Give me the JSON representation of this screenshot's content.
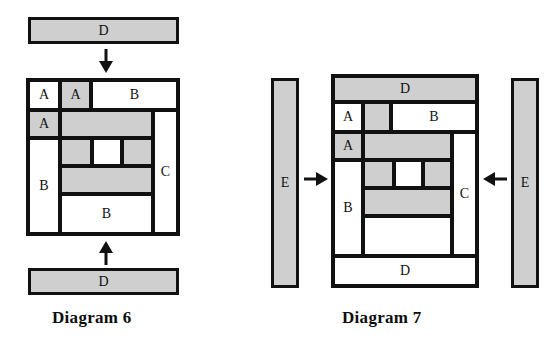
{
  "page": {
    "background": "#ffffff",
    "ink": "#111111",
    "shaded_fill": "#cfcfcf",
    "unshaded_fill": "#ffffff"
  },
  "diagram6": {
    "caption": "Diagram 6",
    "top_bar": {
      "label": "D",
      "shaded": true
    },
    "bottom_bar": {
      "label": "D",
      "shaded": true
    },
    "top_arrow": {
      "name": "arrow-down",
      "direction": "down"
    },
    "bottom_arrow": {
      "name": "arrow-up",
      "direction": "up"
    },
    "cells": [
      {
        "id": "d6-a1",
        "label": "A",
        "shaded": false
      },
      {
        "id": "d6-a2",
        "label": "A",
        "shaded": true
      },
      {
        "id": "d6-b-top",
        "label": "B",
        "shaded": false
      },
      {
        "id": "d6-a3",
        "label": "A",
        "shaded": true
      },
      {
        "id": "d6-band1",
        "label": "",
        "shaded": true
      },
      {
        "id": "d6-c",
        "label": "C",
        "shaded": false
      },
      {
        "id": "d6-b-left",
        "label": "B",
        "shaded": false
      },
      {
        "id": "d6-mid-left",
        "label": "",
        "shaded": true
      },
      {
        "id": "d6-mid-center",
        "label": "",
        "shaded": false
      },
      {
        "id": "d6-mid-right",
        "label": "",
        "shaded": true
      },
      {
        "id": "d6-band2",
        "label": "",
        "shaded": true
      },
      {
        "id": "d6-b-bottom",
        "label": "B",
        "shaded": false
      }
    ]
  },
  "diagram7": {
    "caption": "Diagram 7",
    "left_bar": {
      "label": "E",
      "shaded": true
    },
    "right_bar": {
      "label": "E",
      "shaded": true
    },
    "left_arrow": {
      "name": "arrow-right",
      "direction": "right"
    },
    "right_arrow": {
      "name": "arrow-left",
      "direction": "left"
    },
    "cells": [
      {
        "id": "d7-d-top",
        "label": "D",
        "shaded": true
      },
      {
        "id": "d7-a1",
        "label": "A",
        "shaded": false
      },
      {
        "id": "d7-a2",
        "label": "",
        "shaded": true
      },
      {
        "id": "d7-b-top",
        "label": "B",
        "shaded": false
      },
      {
        "id": "d7-a3",
        "label": "A",
        "shaded": true
      },
      {
        "id": "d7-band1",
        "label": "",
        "shaded": true
      },
      {
        "id": "d7-c",
        "label": "C",
        "shaded": false
      },
      {
        "id": "d7-b-left",
        "label": "B",
        "shaded": false
      },
      {
        "id": "d7-mid-left",
        "label": "",
        "shaded": true
      },
      {
        "id": "d7-mid-center",
        "label": "",
        "shaded": false
      },
      {
        "id": "d7-mid-right",
        "label": "",
        "shaded": true
      },
      {
        "id": "d7-band2",
        "label": "",
        "shaded": true
      },
      {
        "id": "d7-lower-white",
        "label": "",
        "shaded": false
      },
      {
        "id": "d7-d-bottom",
        "label": "D",
        "shaded": false
      }
    ]
  }
}
